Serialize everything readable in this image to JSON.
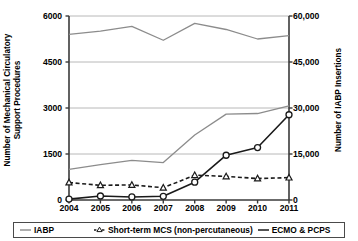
{
  "chart_data": {
    "type": "line",
    "title": "",
    "xlabel": "",
    "ylabel": "Number of Mechanical Circulatory\nSupport Procedures",
    "ylabel_right": "Number of IABP Insertions",
    "categories": [
      "2004",
      "2005",
      "2006",
      "2007",
      "2008",
      "2009",
      "2010",
      "2011"
    ],
    "ylim": [
      0,
      6000
    ],
    "yticks": [
      "0",
      "1500",
      "3000",
      "4500",
      "6000"
    ],
    "ytick_values": [
      0,
      1500,
      3000,
      4500,
      6000
    ],
    "ylim_right": [
      0,
      60000
    ],
    "yticks_right": [
      "0",
      "15,000",
      "30,000",
      "45,000",
      "60,000"
    ],
    "ytick_values_right": [
      0,
      15000,
      30000,
      45000,
      60000
    ],
    "grid": true,
    "legend_position": "bottom",
    "series": [
      {
        "name": "IABP",
        "axis": "right",
        "color": "#8c8c8c",
        "marker": "none",
        "dash": "none",
        "values": [
          54000,
          55100,
          56600,
          52100,
          57600,
          55600,
          52500,
          53600
        ]
      },
      {
        "name": "Total MCS procedures",
        "axis": "left",
        "color": "#8c8c8c",
        "marker": "none",
        "dash": "none",
        "values": [
          1000,
          1150,
          1290,
          1220,
          2120,
          2800,
          2820,
          3070
        ]
      },
      {
        "name": "Short-term MCS (non-percutaneous)",
        "axis": "left",
        "color": "#1a1a1a",
        "marker": "triangle",
        "dash": "dashed",
        "values": [
          570,
          480,
          490,
          400,
          810,
          770,
          700,
          730
        ]
      },
      {
        "name": "ECMO & PCPS",
        "axis": "left",
        "color": "#1a1a1a",
        "marker": "circle",
        "dash": "none",
        "values": [
          30,
          130,
          100,
          120,
          580,
          1460,
          1710,
          2780
        ]
      }
    ]
  },
  "axes": {
    "left_title": "Number of Mechanical Circulatory\nSupport Procedures",
    "right_title": "Number of IABP Insertions",
    "x_labels": [
      "2004",
      "2005",
      "2006",
      "2007",
      "2008",
      "2009",
      "2010",
      "2011"
    ],
    "y_labels_left": [
      "6000",
      "4500",
      "3000",
      "1500",
      "0"
    ],
    "y_labels_right": [
      "60,000",
      "45,000",
      "30,000",
      "15,000",
      "0"
    ]
  },
  "legend": {
    "items": [
      {
        "label": "IABP",
        "marker": "line-gray",
        "color": "#8c8c8c"
      },
      {
        "label": "Short-term MCS (non-percutaneous)",
        "marker": "dashed-triangle",
        "color": "#1a1a1a"
      },
      {
        "label": "ECMO & PCPS",
        "marker": "line-dark",
        "color": "#1a1a1a"
      }
    ]
  },
  "colors": {
    "gray_series": "#8c8c8c",
    "dark_series": "#1a1a1a",
    "grid": "#b8b8b8",
    "axis": "#3a3a3a",
    "background": "#ffffff"
  }
}
